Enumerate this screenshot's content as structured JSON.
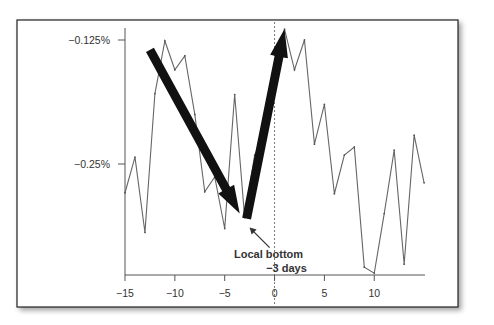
{
  "chart_data": {
    "type": "line",
    "title": "",
    "xlabel": "",
    "ylabel": "",
    "xlim": [
      -15,
      15
    ],
    "ylim": [
      -0.335,
      -0.12
    ],
    "grid": false,
    "legend": "none",
    "x_ticks": [
      -15,
      -10,
      -5,
      0,
      5,
      10
    ],
    "x_tick_labels": [
      "−15",
      "−10",
      "−5",
      "0",
      "5",
      "10"
    ],
    "y_ticks": [
      -0.125,
      -0.25
    ],
    "y_tick_labels": [
      "−0.125%",
      "−0.25%"
    ],
    "series": [
      {
        "name": "return",
        "x": [
          -15,
          -14,
          -13,
          -12,
          -11,
          -10,
          -9,
          -8,
          -7,
          -6,
          -5,
          -4,
          -3,
          -2,
          -1,
          0,
          1,
          2,
          3,
          4,
          5,
          6,
          7,
          8,
          9,
          10,
          11,
          12,
          13,
          14,
          15
        ],
        "values": [
          -0.279,
          -0.243,
          -0.319,
          -0.179,
          -0.126,
          -0.155,
          -0.141,
          -0.2,
          -0.278,
          -0.263,
          -0.315,
          -0.18,
          -0.304,
          -0.241,
          -0.22,
          -0.17,
          -0.114,
          -0.155,
          -0.125,
          -0.23,
          -0.19,
          -0.28,
          -0.241,
          -0.233,
          -0.354,
          -0.36,
          -0.3,
          -0.236,
          -0.351,
          -0.221,
          -0.269
        ]
      }
    ],
    "reference_line": {
      "x": 0,
      "style": "dotted"
    },
    "arrows": [
      {
        "name": "downtrend-arrow",
        "from": [
          -12.5,
          -0.135
        ],
        "to": [
          -3.5,
          -0.3
        ]
      },
      {
        "name": "uptrend-arrow",
        "from": [
          -2.8,
          -0.305
        ],
        "to": [
          1,
          -0.114
        ]
      }
    ],
    "annotation": {
      "lines": [
        "Local bottom",
        "−3 days"
      ],
      "points_to": [
        -3,
        -0.304
      ]
    }
  }
}
